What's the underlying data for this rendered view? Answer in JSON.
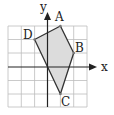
{
  "figure": {
    "type": "coordinate-grid-quadrilateral",
    "axes": {
      "x_label": "x",
      "y_label": "y",
      "x_range": [
        -3,
        3
      ],
      "y_range": [
        -3,
        3
      ],
      "grid": true
    },
    "vertices": [
      {
        "label": "A",
        "x": 1,
        "y": 3
      },
      {
        "label": "B",
        "x": 2,
        "y": 1
      },
      {
        "label": "C",
        "x": 1,
        "y": -2
      },
      {
        "label": "D",
        "x": -1,
        "y": 2
      }
    ],
    "colors": {
      "fill": "#dcdcdc",
      "stroke": "#333333",
      "grid": "#bbbbbb",
      "axis": "#222222"
    }
  }
}
